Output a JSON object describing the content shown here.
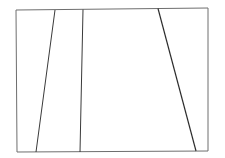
{
  "diagram": {
    "width": 225,
    "height": 158,
    "background": "#ffffff",
    "frame": {
      "points": [
        [
          16,
          10
        ],
        [
          208,
          8
        ],
        [
          208,
          151
        ],
        [
          17,
          152
        ]
      ],
      "stroke": "#6e6e6e",
      "stroke_width": 1
    },
    "lines": [
      {
        "id": "line-1",
        "x1": 55,
        "y1": 10,
        "x2": 36,
        "y2": 152,
        "stroke": "#3a3a3a",
        "stroke_width": 1
      },
      {
        "id": "line-2",
        "x1": 83,
        "y1": 9.5,
        "x2": 80,
        "y2": 152,
        "stroke": "#3a3a3a",
        "stroke_width": 1
      },
      {
        "id": "line-3",
        "x1": 158,
        "y1": 8.5,
        "x2": 196,
        "y2": 151,
        "stroke": "#2e2e2e",
        "stroke_width": 1.2
      }
    ]
  }
}
